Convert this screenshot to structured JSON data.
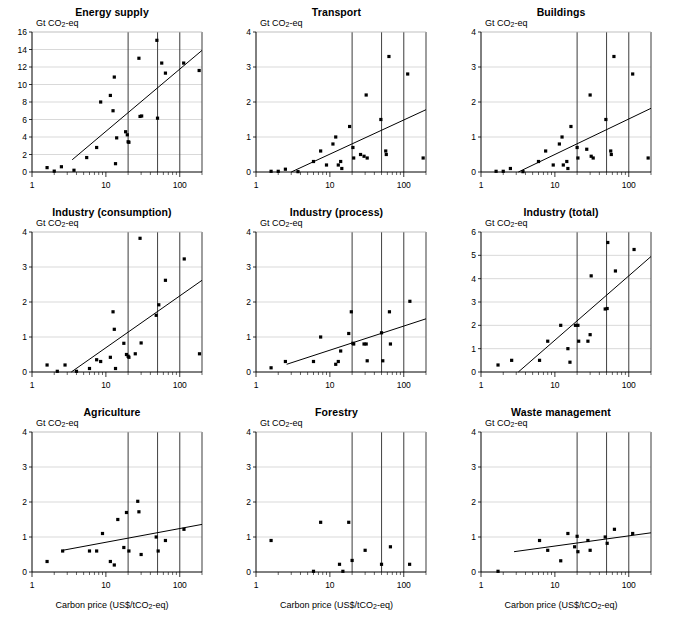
{
  "figure": {
    "ylabel": "Gt CO2-eq",
    "ylabel_main": "Gt CO",
    "ylabel_sub": "2",
    "ylabel_tail": "-eq",
    "xlabel_main": "Carbon price (US$/tCO",
    "xlabel_sub": "2",
    "xlabel_tail": "-eq)",
    "xlabel": "Carbon price (US$/tCO2-eq)",
    "xticks": [
      "1",
      "10",
      "100"
    ],
    "vertical_reference_lines": [
      20,
      50,
      100
    ],
    "marker_color": "#000000",
    "trendline_color": "#000000",
    "gridline_color": "#c8c8c8",
    "reference_line_color": "#4d4d4d"
  },
  "chart_data": [
    {
      "type": "scatter",
      "title": "Energy supply",
      "xlabel": "Carbon price (US$/tCO2-eq)",
      "ylabel": "Gt CO2-eq",
      "xscale": "log",
      "xlim": [
        1,
        200
      ],
      "ylim": [
        0,
        16
      ],
      "yticks": [
        0,
        2,
        4,
        6,
        8,
        10,
        12,
        14,
        16
      ],
      "ytick_labels": [
        "0",
        "2",
        "4",
        "6",
        "8",
        "10",
        "12",
        "14",
        "16"
      ],
      "xtick_labels": [
        "1",
        "10",
        "100"
      ],
      "grid": true,
      "legend": "none",
      "vlines": [
        20,
        50,
        100
      ],
      "points": [
        [
          1.6,
          0.5
        ],
        [
          2.0,
          0.1
        ],
        [
          2.5,
          0.6
        ],
        [
          3.7,
          0.2
        ],
        [
          5.5,
          1.65
        ],
        [
          7.5,
          2.8
        ],
        [
          8.5,
          8.0
        ],
        [
          11.5,
          8.75
        ],
        [
          12.5,
          7.0
        ],
        [
          13.0,
          10.85
        ],
        [
          13.5,
          0.95
        ],
        [
          14.0,
          3.9
        ],
        [
          18.5,
          4.6
        ],
        [
          19.5,
          4.25
        ],
        [
          20.0,
          3.45
        ],
        [
          20.5,
          3.4
        ],
        [
          28.0,
          13.0
        ],
        [
          29.0,
          6.35
        ],
        [
          30.5,
          6.4
        ],
        [
          49.0,
          15.05
        ],
        [
          50.0,
          6.15
        ],
        [
          57.0,
          12.45
        ],
        [
          64.0,
          11.3
        ],
        [
          113.0,
          12.45
        ],
        [
          183.0,
          11.6
        ]
      ],
      "trendline": {
        "x": [
          3.5,
          200
        ],
        "y": [
          1.4,
          13.9
        ]
      }
    },
    {
      "type": "scatter",
      "title": "Transport",
      "xlabel": "Carbon price (US$/tCO2-eq)",
      "ylabel": "Gt CO2-eq",
      "xscale": "log",
      "xlim": [
        1,
        200
      ],
      "ylim": [
        0,
        4
      ],
      "yticks": [
        0,
        1,
        2,
        3,
        4
      ],
      "ytick_labels": [
        "0",
        "1",
        "2",
        "3",
        "4"
      ],
      "xtick_labels": [
        "1",
        "10",
        "100"
      ],
      "grid": true,
      "legend": "none",
      "vlines": [
        20,
        50,
        100
      ],
      "points": [
        [
          1.6,
          0.02
        ],
        [
          2.0,
          0.02
        ],
        [
          2.5,
          0.08
        ],
        [
          3.7,
          0.01
        ],
        [
          6.0,
          0.3
        ],
        [
          7.5,
          0.6
        ],
        [
          9.0,
          0.2
        ],
        [
          11.0,
          0.8
        ],
        [
          12.0,
          1.0
        ],
        [
          13.0,
          0.2
        ],
        [
          14.0,
          0.3
        ],
        [
          14.5,
          0.1
        ],
        [
          18.5,
          1.3
        ],
        [
          20.5,
          0.7
        ],
        [
          21.0,
          0.4
        ],
        [
          26.0,
          0.5
        ],
        [
          29.0,
          0.45
        ],
        [
          31.0,
          2.2
        ],
        [
          32.0,
          0.4
        ],
        [
          49.0,
          1.5
        ],
        [
          57.0,
          0.6
        ],
        [
          58.0,
          0.5
        ],
        [
          63.0,
          3.3
        ],
        [
          113.0,
          2.8
        ],
        [
          183.0,
          0.4
        ]
      ],
      "trendline": {
        "x": [
          3.0,
          200
        ],
        "y": [
          0.0,
          1.78
        ]
      }
    },
    {
      "type": "scatter",
      "title": "Buildings",
      "xlabel": "Carbon price (US$/tCO2-eq)",
      "ylabel": "Gt CO2-eq",
      "xscale": "log",
      "xlim": [
        1,
        200
      ],
      "ylim": [
        0,
        4
      ],
      "yticks": [
        0,
        1,
        2,
        3,
        4
      ],
      "ytick_labels": [
        "0",
        "1",
        "2",
        "3",
        "4"
      ],
      "xtick_labels": [
        "1",
        "10",
        "100"
      ],
      "grid": true,
      "legend": "none",
      "vlines": [
        20,
        50,
        100
      ],
      "points": [
        [
          1.6,
          0.02
        ],
        [
          2.0,
          0.02
        ],
        [
          2.5,
          0.1
        ],
        [
          3.7,
          0.01
        ],
        [
          6.0,
          0.3
        ],
        [
          7.5,
          0.6
        ],
        [
          9.5,
          0.2
        ],
        [
          11.5,
          0.8
        ],
        [
          12.5,
          1.0
        ],
        [
          13.0,
          0.2
        ],
        [
          14.5,
          0.3
        ],
        [
          15.0,
          0.1
        ],
        [
          16.5,
          1.3
        ],
        [
          20.0,
          0.7
        ],
        [
          20.5,
          0.4
        ],
        [
          27.0,
          0.65
        ],
        [
          30.0,
          2.2
        ],
        [
          31.0,
          0.45
        ],
        [
          33.0,
          0.4
        ],
        [
          49.0,
          1.5
        ],
        [
          57.0,
          0.6
        ],
        [
          58.0,
          0.5
        ],
        [
          63.0,
          3.3
        ],
        [
          113.0,
          2.8
        ],
        [
          183.0,
          0.4
        ]
      ],
      "trendline": {
        "x": [
          3.2,
          200
        ],
        "y": [
          0.0,
          1.82
        ]
      }
    },
    {
      "type": "scatter",
      "title": "Industry (consumption)",
      "xlabel": "Carbon price (US$/tCO2-eq)",
      "ylabel": "Gt CO2-eq",
      "xscale": "log",
      "xlim": [
        1,
        200
      ],
      "ylim": [
        0,
        4
      ],
      "yticks": [
        0,
        1,
        2,
        3,
        4
      ],
      "ytick_labels": [
        "0",
        "1",
        "2",
        "3",
        "4"
      ],
      "xtick_labels": [
        "1",
        "10",
        "100"
      ],
      "grid": true,
      "legend": "none",
      "vlines": [
        20,
        50,
        100
      ],
      "points": [
        [
          1.6,
          0.2
        ],
        [
          2.2,
          0.02
        ],
        [
          2.8,
          0.2
        ],
        [
          4.0,
          0.02
        ],
        [
          6.0,
          0.1
        ],
        [
          7.5,
          0.35
        ],
        [
          8.5,
          0.3
        ],
        [
          11.5,
          0.42
        ],
        [
          12.5,
          1.72
        ],
        [
          13.0,
          1.22
        ],
        [
          13.5,
          0.1
        ],
        [
          17.5,
          0.82
        ],
        [
          19.0,
          0.5
        ],
        [
          20.0,
          0.45
        ],
        [
          20.5,
          0.42
        ],
        [
          25.0,
          0.52
        ],
        [
          29.0,
          3.82
        ],
        [
          30.0,
          0.83
        ],
        [
          48.0,
          1.62
        ],
        [
          52.0,
          1.92
        ],
        [
          64.0,
          2.62
        ],
        [
          115.0,
          3.23
        ],
        [
          185.0,
          0.52
        ]
      ],
      "trendline": {
        "x": [
          3.4,
          200
        ],
        "y": [
          0.0,
          2.62
        ]
      }
    },
    {
      "type": "scatter",
      "title": "Industry (process)",
      "xlabel": "Carbon price (US$/tCO2-eq)",
      "ylabel": "Gt CO2-eq",
      "xscale": "log",
      "xlim": [
        1,
        200
      ],
      "ylim": [
        0,
        4
      ],
      "yticks": [
        0,
        1,
        2,
        3,
        4
      ],
      "ytick_labels": [
        "0",
        "1",
        "2",
        "3",
        "4"
      ],
      "xtick_labels": [
        "1",
        "10",
        "100"
      ],
      "grid": true,
      "legend": "none",
      "vlines": [
        20,
        50,
        100
      ],
      "points": [
        [
          1.6,
          0.12
        ],
        [
          2.5,
          0.3
        ],
        [
          6.0,
          0.3
        ],
        [
          7.5,
          1.0
        ],
        [
          12.0,
          0.22
        ],
        [
          13.0,
          0.3
        ],
        [
          14.0,
          0.6
        ],
        [
          18.0,
          1.1
        ],
        [
          19.5,
          1.72
        ],
        [
          20.5,
          0.82
        ],
        [
          21.0,
          0.8
        ],
        [
          29.0,
          0.8
        ],
        [
          31.0,
          0.8
        ],
        [
          32.0,
          0.32
        ],
        [
          50.0,
          1.12
        ],
        [
          52.0,
          0.32
        ],
        [
          64.0,
          1.72
        ],
        [
          66.0,
          0.8
        ],
        [
          121.0,
          2.02
        ]
      ],
      "trendline": {
        "x": [
          2.6,
          200
        ],
        "y": [
          0.22,
          1.52
        ]
      }
    },
    {
      "type": "scatter",
      "title": "Industry (total)",
      "xlabel": "Carbon price (US$/tCO2-eq)",
      "ylabel": "Gt CO2-eq",
      "xscale": "log",
      "xlim": [
        1,
        200
      ],
      "ylim": [
        0,
        6
      ],
      "yticks": [
        0,
        1,
        2,
        3,
        4,
        5,
        6
      ],
      "ytick_labels": [
        "0",
        "1",
        "2",
        "3",
        "4",
        "5",
        "6"
      ],
      "xtick_labels": [
        "1",
        "10",
        "100"
      ],
      "grid": true,
      "legend": "none",
      "vlines": [
        20,
        50,
        100
      ],
      "points": [
        [
          1.7,
          0.3
        ],
        [
          2.6,
          0.5
        ],
        [
          6.2,
          0.5
        ],
        [
          8.0,
          1.32
        ],
        [
          12.0,
          2.0
        ],
        [
          15.0,
          1.0
        ],
        [
          16.0,
          0.42
        ],
        [
          19.0,
          2.0
        ],
        [
          20.5,
          2.0
        ],
        [
          21.0,
          1.32
        ],
        [
          28.0,
          1.32
        ],
        [
          30.0,
          1.6
        ],
        [
          31.0,
          4.12
        ],
        [
          48.0,
          2.7
        ],
        [
          51.0,
          2.72
        ],
        [
          52.0,
          5.55
        ],
        [
          66.0,
          4.33
        ],
        [
          118.0,
          5.25
        ]
      ],
      "trendline": {
        "x": [
          3.2,
          200
        ],
        "y": [
          0.0,
          4.95
        ]
      }
    },
    {
      "type": "scatter",
      "title": "Agriculture",
      "xlabel": "Carbon price (US$/tCO2-eq)",
      "ylabel": "Gt CO2-eq",
      "xscale": "log",
      "xlim": [
        1,
        200
      ],
      "ylim": [
        0,
        4
      ],
      "yticks": [
        0,
        1,
        2,
        3,
        4
      ],
      "ytick_labels": [
        "0",
        "1",
        "2",
        "3",
        "4"
      ],
      "xtick_labels": [
        "1",
        "10",
        "100"
      ],
      "grid": true,
      "legend": "none",
      "vlines": [
        20,
        50,
        100
      ],
      "points": [
        [
          1.6,
          0.3
        ],
        [
          2.6,
          0.6
        ],
        [
          6.0,
          0.6
        ],
        [
          7.5,
          0.6
        ],
        [
          9.0,
          1.1
        ],
        [
          11.5,
          0.3
        ],
        [
          13.0,
          0.2
        ],
        [
          14.5,
          1.5
        ],
        [
          17.5,
          0.7
        ],
        [
          19.0,
          1.7
        ],
        [
          20.5,
          0.6
        ],
        [
          27.0,
          2.02
        ],
        [
          28.0,
          1.72
        ],
        [
          30.0,
          0.5
        ],
        [
          48.0,
          1.0
        ],
        [
          51.0,
          0.6
        ],
        [
          64.0,
          0.9
        ],
        [
          114.0,
          1.22
        ]
      ],
      "trendline": {
        "x": [
          2.6,
          200
        ],
        "y": [
          0.62,
          1.36
        ]
      }
    },
    {
      "type": "scatter",
      "title": "Forestry",
      "xlabel": "Carbon price (US$/tCO2-eq)",
      "ylabel": "Gt CO2-eq",
      "xscale": "log",
      "xlim": [
        1,
        200
      ],
      "ylim": [
        0,
        4
      ],
      "yticks": [
        0,
        1,
        2,
        3,
        4
      ],
      "ytick_labels": [
        "0",
        "1",
        "2",
        "3",
        "4"
      ],
      "xtick_labels": [
        "1",
        "10",
        "100"
      ],
      "grid": true,
      "legend": "none",
      "vlines": [
        20,
        50,
        100
      ],
      "points": [
        [
          1.6,
          0.9
        ],
        [
          6.0,
          0.02
        ],
        [
          7.5,
          1.42
        ],
        [
          13.5,
          0.22
        ],
        [
          15.0,
          0.02
        ],
        [
          18.0,
          1.42
        ],
        [
          20.0,
          0.33
        ],
        [
          30.0,
          0.62
        ],
        [
          50.0,
          0.22
        ],
        [
          66.0,
          0.72
        ],
        [
          120.0,
          0.22
        ]
      ],
      "trendline": null
    },
    {
      "type": "scatter",
      "title": "Waste management",
      "xlabel": "Carbon price (US$/tCO2-eq)",
      "ylabel": "Gt CO2-eq",
      "xscale": "log",
      "xlim": [
        1,
        200
      ],
      "ylim": [
        0,
        4
      ],
      "yticks": [
        0,
        1,
        2,
        3,
        4
      ],
      "ytick_labels": [
        "0",
        "1",
        "2",
        "3",
        "4"
      ],
      "xtick_labels": [
        "1",
        "10",
        "100"
      ],
      "grid": true,
      "legend": "none",
      "vlines": [
        20,
        50,
        100
      ],
      "points": [
        [
          1.7,
          0.02
        ],
        [
          6.2,
          0.9
        ],
        [
          8.0,
          0.62
        ],
        [
          12.0,
          0.32
        ],
        [
          15.0,
          1.1
        ],
        [
          18.5,
          0.72
        ],
        [
          20.0,
          1.02
        ],
        [
          20.5,
          0.58
        ],
        [
          28.0,
          0.9
        ],
        [
          30.0,
          0.62
        ],
        [
          48.0,
          1.0
        ],
        [
          51.0,
          0.82
        ],
        [
          64.0,
          1.22
        ],
        [
          113.0,
          1.1
        ]
      ],
      "trendline": {
        "x": [
          2.8,
          200
        ],
        "y": [
          0.58,
          1.12
        ]
      }
    }
  ]
}
